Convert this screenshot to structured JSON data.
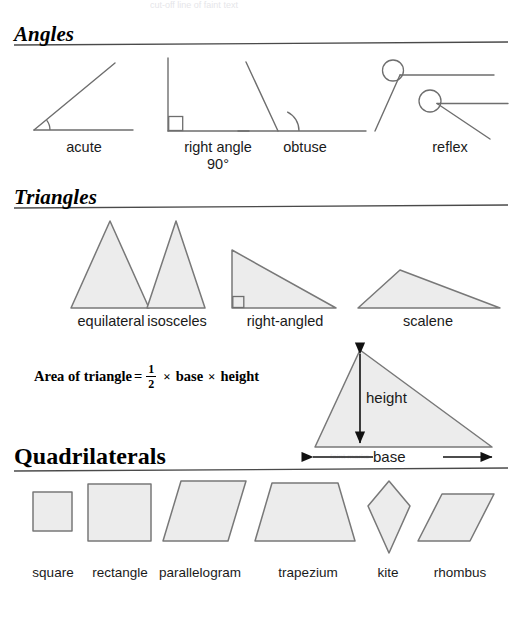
{
  "page": {
    "background_color": "#ffffff",
    "width": 520,
    "height": 617,
    "top_artifact_text": "cut-off line of faint text",
    "bottom_right_artifact_text": "faint marks"
  },
  "style": {
    "shape_fill": "#ececec",
    "shape_stroke": "#787878",
    "line_stroke": "#6e6e6e",
    "rule_color": "#4a4a4a",
    "text_color": "#1a1a1a",
    "heading_color": "#000000"
  },
  "sections": {
    "angles": {
      "heading": "Angles",
      "heading_style": "bold-italic-serif-underlined",
      "items": [
        {
          "label": "acute",
          "label2": "",
          "name": "acute-angle"
        },
        {
          "label": "right angle",
          "label2": "90°",
          "name": "right-angle"
        },
        {
          "label": "obtuse",
          "label2": "",
          "name": "obtuse-angle"
        },
        {
          "label": "reflex",
          "label2": "",
          "name": "reflex-angle"
        }
      ]
    },
    "triangles": {
      "heading": "Triangles",
      "heading_style": "bold-italic-serif-underlined",
      "items": [
        {
          "label": "equilateral",
          "name": "equilateral-triangle"
        },
        {
          "label": "isosceles",
          "name": "isosceles-triangle"
        },
        {
          "label": "right-angled",
          "name": "right-angled-triangle"
        },
        {
          "label": "scalene",
          "name": "scalene-triangle"
        }
      ],
      "formula": {
        "lhs": "Area of triangle",
        "equals": "=",
        "fraction_numerator": "1",
        "fraction_denominator": "2",
        "times1": "×",
        "term1": "base",
        "times2": "×",
        "term2": "height"
      },
      "labelled_diagram": {
        "height_label": "height",
        "base_label": "base"
      }
    },
    "quadrilaterals": {
      "heading": "Quadrilaterals",
      "heading_style": "bold-serif-underlined",
      "items": [
        {
          "label": "square",
          "name": "square-shape"
        },
        {
          "label": "rectangle",
          "name": "rectangle-shape"
        },
        {
          "label": "parallelogram",
          "name": "parallelogram-shape"
        },
        {
          "label": "trapezium",
          "name": "trapezium-shape"
        },
        {
          "label": "kite",
          "name": "kite-shape"
        },
        {
          "label": "rhombus",
          "name": "rhombus-shape"
        }
      ]
    }
  }
}
